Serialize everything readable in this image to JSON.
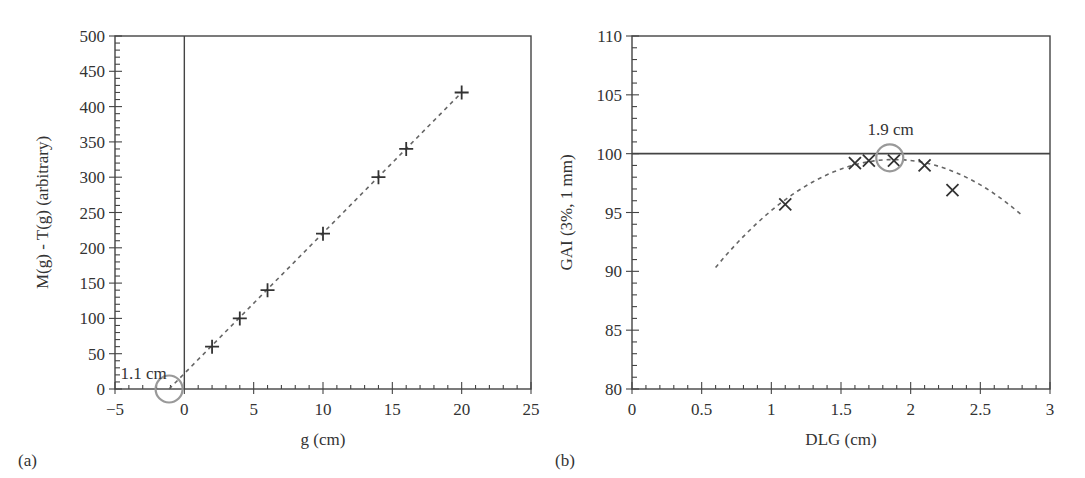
{
  "figure": {
    "width": 1085,
    "height": 478,
    "colors": {
      "axis": "#444444",
      "text": "#333333",
      "marker": "#333333",
      "fit_line": "#666666",
      "circle": "#999999",
      "background": "#ffffff"
    }
  },
  "chart_data": [
    {
      "id": "a",
      "panel_label": "(a)",
      "type": "scatter",
      "title": "",
      "xlabel": "g (cm)",
      "ylabel": "M(g) - T(g) (arbitrary)",
      "xlim": [
        -5,
        25
      ],
      "ylim": [
        0,
        500
      ],
      "xticks": [
        -5,
        0,
        5,
        10,
        15,
        20,
        25
      ],
      "xtick_labels": [
        "−5",
        "0",
        "5",
        "10",
        "15",
        "20",
        "25"
      ],
      "x_minor_step": 1,
      "yticks": [
        0,
        50,
        100,
        150,
        200,
        250,
        300,
        350,
        400,
        450,
        500
      ],
      "ytick_labels": [
        "0",
        "50",
        "100",
        "150",
        "200",
        "250",
        "300",
        "350",
        "400",
        "450",
        "500"
      ],
      "y_minor_step": 10,
      "grid": false,
      "marker": "plus",
      "series": [
        {
          "name": "measured",
          "x": [
            2,
            4,
            6,
            10,
            14,
            16,
            20
          ],
          "y": [
            60,
            100,
            140,
            220,
            300,
            340,
            420
          ]
        }
      ],
      "fit_line": {
        "style": "dashed",
        "x": [
          -1.1,
          20
        ],
        "y": [
          0,
          420
        ]
      },
      "reference_lines": [
        {
          "orientation": "vertical",
          "value": 0
        }
      ],
      "annotations": [
        {
          "text": "1.1 cm",
          "circle_at": [
            -1.1,
            0
          ],
          "text_at": [
            -4.6,
            14
          ]
        }
      ]
    },
    {
      "id": "b",
      "panel_label": "(b)",
      "type": "scatter",
      "title": "",
      "xlabel": "DLG (cm)",
      "ylabel": "GAI (3%, 1 mm)",
      "xlim": [
        0,
        3
      ],
      "ylim": [
        80,
        110
      ],
      "xticks": [
        0,
        0.5,
        1,
        1.5,
        2,
        2.5,
        3
      ],
      "xtick_labels": [
        "0",
        "0.5",
        "1",
        "1.5",
        "2",
        "2.5",
        "3"
      ],
      "x_minor_step": 0.1,
      "yticks": [
        80,
        85,
        90,
        95,
        100,
        105,
        110
      ],
      "ytick_labels": [
        "80",
        "85",
        "90",
        "95",
        "100",
        "105",
        "110"
      ],
      "y_minor_step": 1,
      "grid": false,
      "marker": "x",
      "series": [
        {
          "name": "measured",
          "x": [
            1.1,
            1.6,
            1.7,
            1.88,
            2.1,
            2.3
          ],
          "y": [
            95.7,
            99.2,
            99.4,
            99.4,
            99.0,
            96.9
          ]
        }
      ],
      "fit_curve": {
        "style": "dashed",
        "type": "quadratic",
        "x_range": [
          0.6,
          2.8
        ],
        "vertex": [
          1.88,
          99.5
        ],
        "a": -5.6
      },
      "reference_lines": [
        {
          "orientation": "horizontal",
          "value": 100
        }
      ],
      "annotations": [
        {
          "text": "1.9 cm",
          "circle_at": [
            1.85,
            99.65
          ],
          "text_at": [
            1.69,
            101.6
          ]
        }
      ]
    }
  ]
}
